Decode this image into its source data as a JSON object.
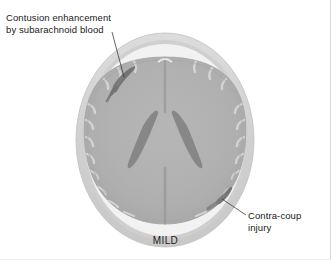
{
  "figure": {
    "modality_view": "axial brain section",
    "severity_caption": "MILD",
    "annotations": [
      {
        "id": "contusion",
        "text": "Contusion enhancement\nby subarachnoid blood",
        "position": "top-left",
        "points_to": "upper-left cortical margin lesion"
      },
      {
        "id": "contracoup",
        "text": "Contra-coup\ninjury",
        "position": "bottom-right",
        "points_to": "lower-right cortical margin lesion"
      }
    ],
    "colors": {
      "background": "#ffffff",
      "skull_outer": "#d2d2d2",
      "skull_inner": "#c4c4c4",
      "csf_space": "#f4f4f4",
      "brain_parenchyma": "#b0b0b0",
      "brain_edge": "#9d9d9d",
      "ventricle": "#8a8a8a",
      "fissure": "#a0a0a0",
      "lesion": "#707070",
      "leader_line": "#3c3c3c",
      "text": "#1a1a1a",
      "frame": "#d8d8d8"
    },
    "structures": [
      {
        "name": "skull",
        "label": "skull / scalp ring"
      },
      {
        "name": "subarachnoid-space",
        "label": "CSF space"
      },
      {
        "name": "left-hemisphere",
        "label": "left cerebral hemisphere"
      },
      {
        "name": "right-hemisphere",
        "label": "right cerebral hemisphere"
      },
      {
        "name": "interhemispheric-fissure",
        "label": "interhemispheric fissure"
      },
      {
        "name": "lateral-ventricles",
        "label": "lateral ventricles"
      },
      {
        "name": "contusion-lesion",
        "label": "contusion enhancement"
      },
      {
        "name": "contracoup-lesion",
        "label": "contra-coup injury"
      }
    ]
  }
}
